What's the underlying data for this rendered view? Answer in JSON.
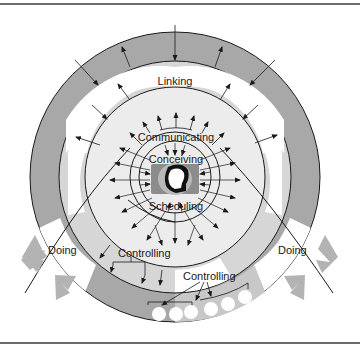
{
  "diagram": {
    "labels": {
      "linking": "Linking",
      "communicating": "Communicating",
      "conceiving": "Conceiving",
      "scheduling": "Scheduling",
      "doing_left": "Doing",
      "doing_right": "Doing",
      "controlling_inner": "Controlling",
      "controlling_outer": "Controlling"
    },
    "colors": {
      "outer_ring": "#a6a6a6",
      "light_ring": "#d4d4d4",
      "inner_disk": "#ececec",
      "linking_band": "#ffffff",
      "arrow_gray": "#b3b3b3",
      "line": "#1a1a1a"
    }
  }
}
